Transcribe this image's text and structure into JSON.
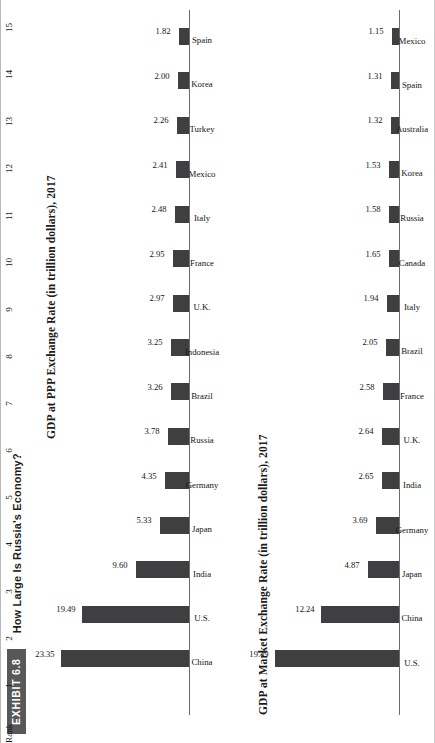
{
  "exhibit": {
    "tag": "EXHIBIT 6.8",
    "title": "How Large Is Russia's Economy?"
  },
  "rank": {
    "header": "Rank",
    "values": [
      "1",
      "2",
      "3",
      "4",
      "5",
      "6",
      "7",
      "8",
      "9",
      "10",
      "11",
      "12",
      "13",
      "14",
      "15"
    ]
  },
  "colors": {
    "bar": "#3f3f42",
    "axis": "#6b6b6b",
    "tag_background": "#585858",
    "tag_text": "#ffffff",
    "page_background": "#ffffff"
  },
  "chart_data": [
    {
      "id": "ppp",
      "type": "bar",
      "title": "GDP at PPP Exchange Rate (in trillion dollars), 2017",
      "xlabel": "",
      "ylabel": "",
      "ylim": [
        0,
        23.35
      ],
      "grid": false,
      "legend": "none",
      "categories": [
        "China",
        "U.S.",
        "India",
        "Japan",
        "Germany",
        "Russia",
        "Brazil",
        "Indonesia",
        "U.K.",
        "France",
        "Italy",
        "Mexico",
        "Turkey",
        "Korea",
        "Spain"
      ],
      "values": [
        23.35,
        19.49,
        9.6,
        5.33,
        4.35,
        3.78,
        3.26,
        3.25,
        2.97,
        2.95,
        2.48,
        2.41,
        2.26,
        2.0,
        1.82
      ],
      "value_labels": [
        "23.35",
        "19.49",
        "9.60",
        "5.33",
        "4.35",
        "3.78",
        "3.26",
        "3.25",
        "2.97",
        "2.95",
        "2.48",
        "2.41",
        "2.26",
        "2.00",
        "1.82"
      ]
    },
    {
      "id": "market",
      "type": "bar",
      "title": "GDP at Market Exchange Rate (in trillion dollars), 2017",
      "xlabel": "",
      "ylabel": "",
      "ylim": [
        0,
        19.49
      ],
      "grid": false,
      "legend": "none",
      "categories": [
        "U.S.",
        "China",
        "Japan",
        "Germany",
        "India",
        "U.K.",
        "France",
        "Brazil",
        "Italy",
        "Canada",
        "Russia",
        "Korea",
        "Australia",
        "Spain",
        "Mexico"
      ],
      "values": [
        19.49,
        12.24,
        4.87,
        3.69,
        2.65,
        2.64,
        2.58,
        2.05,
        1.94,
        1.65,
        1.58,
        1.53,
        1.32,
        1.31,
        1.15
      ],
      "value_labels": [
        "19.49",
        "12.24",
        "4.87",
        "3.69",
        "2.65",
        "2.64",
        "2.58",
        "2.05",
        "1.94",
        "1.65",
        "1.58",
        "1.53",
        "1.32",
        "1.31",
        "1.15"
      ]
    }
  ]
}
